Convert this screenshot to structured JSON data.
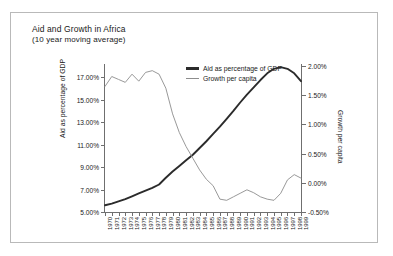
{
  "chart_data": {
    "type": "line",
    "title": "Aid and Growth in Africa",
    "subtitle": "(10 year moving average)",
    "xlabel": "",
    "ylabel": "Aid as percentage of GDP",
    "y2label": "Growth per capita",
    "ylim": [
      5.0,
      18.0
    ],
    "y2lim": [
      -0.5,
      2.0
    ],
    "ytick_labels": [
      "5.00%",
      "7.00%",
      "9.00%",
      "11.00%",
      "13.00%",
      "15.00%",
      "17.00%"
    ],
    "ytick_values": [
      5.0,
      7.0,
      9.0,
      11.0,
      13.0,
      15.0,
      17.0
    ],
    "y2tick_labels": [
      "-0.50%",
      "0.00%",
      "0.50%",
      "1.00%",
      "1.50%",
      "2.00%"
    ],
    "y2tick_values": [
      -0.5,
      0.0,
      0.5,
      1.0,
      1.5,
      2.0
    ],
    "grid": false,
    "legend_position": "top-center",
    "categories": [
      "1970",
      "1971",
      "1972",
      "1973",
      "1974",
      "1975",
      "1976",
      "1977",
      "1978",
      "1979",
      "1980",
      "1981",
      "1982",
      "1983",
      "1984",
      "1985",
      "1986",
      "1987",
      "1988",
      "1989",
      "1990",
      "1991",
      "1992",
      "1993",
      "1994",
      "1995",
      "1996",
      "1997",
      "1998",
      "1999"
    ],
    "series": [
      {
        "name": "Aid as percentage of GDP",
        "axis": "left",
        "color": "#2b2b2b",
        "values": [
          5.6,
          5.75,
          5.95,
          6.15,
          6.4,
          6.65,
          6.9,
          7.15,
          7.45,
          8.05,
          8.6,
          9.1,
          9.6,
          10.1,
          10.7,
          11.3,
          11.95,
          12.6,
          13.3,
          14.0,
          14.75,
          15.45,
          16.1,
          16.75,
          17.35,
          17.75,
          17.9,
          17.75,
          17.35,
          16.65
        ]
      },
      {
        "name": "Growth per capita",
        "axis": "right",
        "color": "#8d8d8d",
        "values": [
          1.65,
          1.82,
          1.77,
          1.72,
          1.86,
          1.74,
          1.89,
          1.92,
          1.86,
          1.62,
          1.18,
          0.86,
          0.62,
          0.42,
          0.22,
          0.06,
          -0.05,
          -0.28,
          -0.3,
          -0.24,
          -0.18,
          -0.12,
          -0.17,
          -0.24,
          -0.28,
          -0.3,
          -0.18,
          0.05,
          0.14,
          0.08
        ]
      }
    ]
  },
  "legend": {
    "items": [
      {
        "label": "Aid as percentage of GDP"
      },
      {
        "label": "Growth per capita"
      }
    ]
  }
}
